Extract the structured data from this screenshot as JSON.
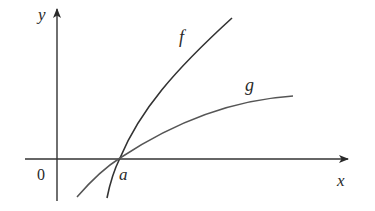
{
  "diagram": {
    "axes": {
      "x_label": "x",
      "y_label": "y",
      "origin_label": "0"
    },
    "point": {
      "label": "a",
      "description": "intersection of f and g on the x-axis"
    },
    "curves": [
      {
        "name": "f",
        "label": "f",
        "color": "#333333"
      },
      {
        "name": "g",
        "label": "g",
        "color": "#555555"
      }
    ],
    "colors": {
      "axis": "#333333",
      "background": "#ffffff"
    }
  }
}
